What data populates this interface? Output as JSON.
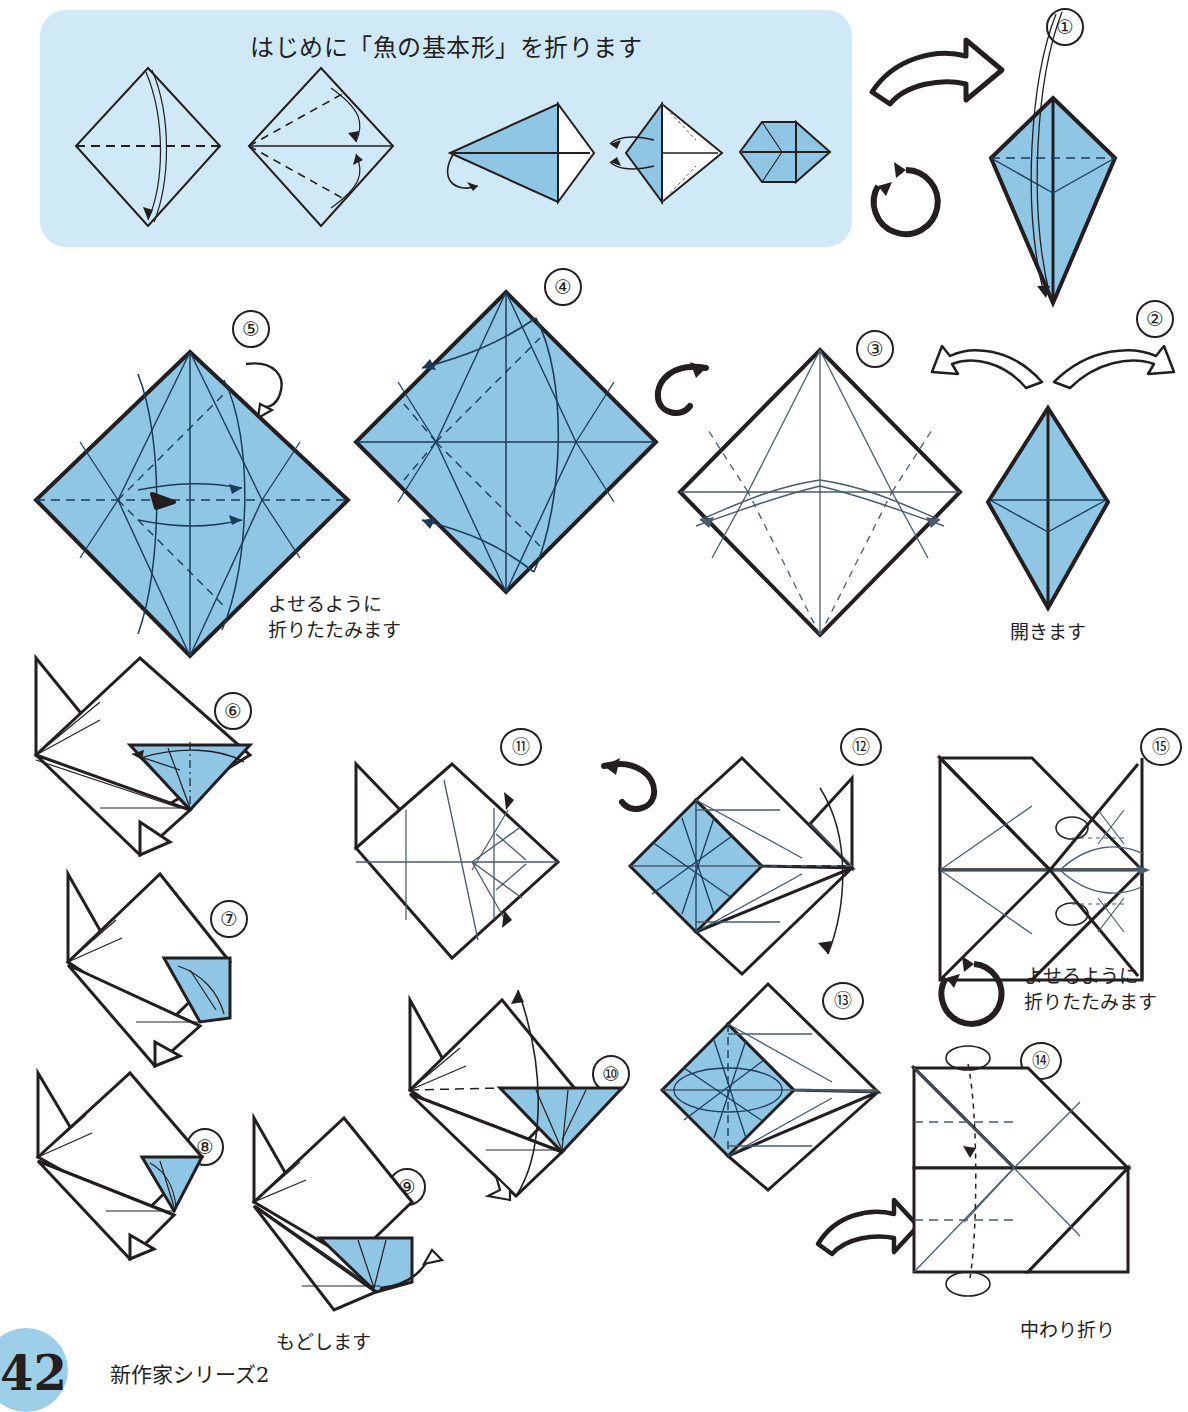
{
  "page": {
    "number": "42",
    "series_label": "新作家シリーズ2",
    "page_badge_color": "#9ecfe8"
  },
  "colors": {
    "panel_background": "#cfe9f6",
    "paper_blue": "#8ec6e4",
    "paper_white": "#ffffff",
    "ink": "#231f20",
    "crease_line": "#4a5b6b"
  },
  "intro": {
    "title": "はじめに「魚の基本形」を折ります",
    "sub_steps": [
      {
        "id": "intro-a",
        "name": "diamond-valley-fold",
        "fill": "white"
      },
      {
        "id": "intro-b",
        "name": "diamond-kite-folds",
        "fill": "white"
      },
      {
        "id": "intro-c",
        "name": "kite-side-view",
        "fill": "blue"
      },
      {
        "id": "intro-d",
        "name": "petal-fold",
        "fill": "blue"
      },
      {
        "id": "intro-e",
        "name": "fish-base",
        "fill": "blue"
      }
    ]
  },
  "steps": [
    {
      "num": "①",
      "name": "step-1-fish-base-kite",
      "caption": ""
    },
    {
      "num": "②",
      "name": "step-2-open",
      "caption": "開きます"
    },
    {
      "num": "③",
      "name": "step-3-unfolded-square-white",
      "caption": ""
    },
    {
      "num": "④",
      "name": "step-4-creased-square-blue",
      "caption": ""
    },
    {
      "num": "⑤",
      "name": "step-5-collapse-square-blue",
      "caption": "よせるように\n折りたたみます"
    },
    {
      "num": "⑥",
      "name": "step-6-folded-form",
      "caption": ""
    },
    {
      "num": "⑦",
      "name": "step-7-folded-form",
      "caption": ""
    },
    {
      "num": "⑧",
      "name": "step-8-folded-form",
      "caption": ""
    },
    {
      "num": "⑨",
      "name": "step-9-unfold-back",
      "caption": "もどします"
    },
    {
      "num": "⑩",
      "name": "step-10-open-flap",
      "caption": ""
    },
    {
      "num": "⑪",
      "name": "step-11-flat-square-white",
      "caption": ""
    },
    {
      "num": "⑫",
      "name": "step-12-turn-over-blue-panel",
      "caption": ""
    },
    {
      "num": "⑬",
      "name": "step-13-blue-panel",
      "caption": ""
    },
    {
      "num": "⑭",
      "name": "step-14-inside-reverse-fold",
      "caption": "中わり折り"
    },
    {
      "num": "⑮",
      "name": "step-15-collapse",
      "caption": "よせるように\n折りたたみます"
    }
  ],
  "symbols": {
    "turn_over_hollow_arrow": "turn-over-arrow-icon",
    "rotate_circle_arrow": "rotate-arrow-icon",
    "flip_arrow": "flip-arrow-icon",
    "valley_fold": "dashed-line",
    "mountain_fold": "dash-dot-line",
    "push_here": "solid-black-arrow"
  }
}
